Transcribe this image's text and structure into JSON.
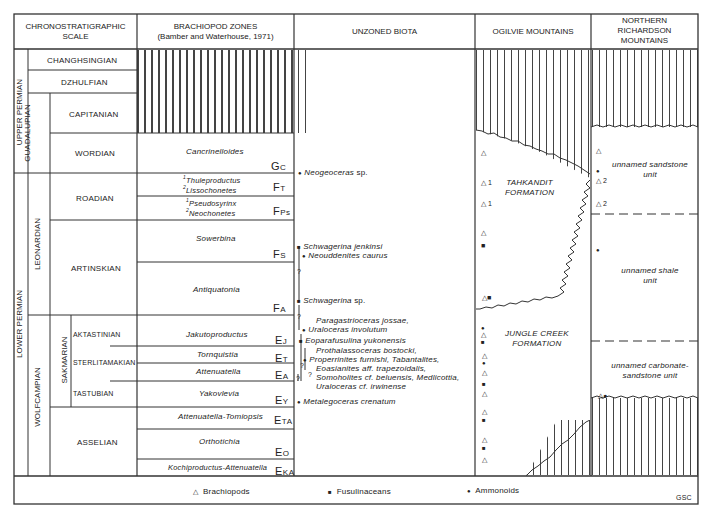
{
  "headers": {
    "chrono": "CHRONOSTRATIGRAPHIC SCALE",
    "chrono_line1": "CHRONOSTRATIGRAPHIC",
    "chrono_line2": "SCALE",
    "brachiopod_line1": "BRACHIOPOD ZONES",
    "brachiopod_line2": "(Bamber and Waterhouse, 1971)",
    "unzoned": "UNZONED BIOTA",
    "ogilvie": "OGILVIE MOUNTAINS",
    "richardson_line1": "NORTHERN",
    "richardson_line2": "RICHARDSON",
    "richardson_line3": "MOUNTAINS"
  },
  "series": {
    "upper": "UPPER PERMIAN",
    "lower": "LOWER PERMIAN"
  },
  "subseries": {
    "guadalupian": "GUADALUPIAN",
    "leonardian": "LEONARDIAN",
    "wolfcampian": "WOLFCAMPIAN",
    "sakmarian": "SAKMARIAN"
  },
  "stages": {
    "changhsingian": "CHANGHSINGIAN",
    "dzhulfian": "DZHULFIAN",
    "capitanian": "CAPITANIAN",
    "wordian": "WORDIAN",
    "roadian": "ROADIAN",
    "artinskian": "ARTINSKIAN",
    "aktastinian": "AKTASTINIAN",
    "sterlitamakian": "STERLITAMAKIAN",
    "tastubian": "TASTUBIAN",
    "asselian": "ASSELIAN"
  },
  "zones": [
    {
      "name": "Cancrinelloides",
      "code": "G",
      "sub": "C"
    },
    {
      "sup1": "1",
      "name1": "Thuleproductus",
      "sup2": "2",
      "name2": "Lissochonetes",
      "code": "F",
      "sub": "T"
    },
    {
      "sup1": "1",
      "name1": "Pseudosyrinx",
      "sup2": "2",
      "name2": "Neochonetes",
      "code": "F",
      "sub": "Ps"
    },
    {
      "name": "Sowerbina",
      "code": "F",
      "sub": "S"
    },
    {
      "name": "Antiquatonia",
      "code": "F",
      "sub": "A"
    },
    {
      "name": "Jakutoproductus",
      "code": "E",
      "sub": "J"
    },
    {
      "name": "Tornquistia",
      "code": "E",
      "sub": "T"
    },
    {
      "name": "Attenuatella",
      "code": "E",
      "sub": "A"
    },
    {
      "name": "Yakovlevia",
      "code": "E",
      "sub": "Y"
    },
    {
      "name": "Attenuatella-Tomiopsis",
      "code": "E",
      "sub": "TA"
    },
    {
      "name": "Orthotichia",
      "code": "E",
      "sub": "O"
    },
    {
      "name": "Kochiproductus-Attenuatella",
      "code": "E",
      "sub": "KA"
    }
  ],
  "biota": [
    {
      "symbol": "●",
      "name": "Neogeoceras",
      "suffix": " sp."
    },
    {
      "symbol": "■",
      "name": "Schwagerina jenkinsi",
      "suffix": ""
    },
    {
      "symbol": "●",
      "name": "Neouddenites caurus",
      "suffix": ""
    },
    {
      "symbol": "■",
      "name": "Schwagerina",
      "suffix": " sp."
    },
    {
      "symbol": "",
      "name": "Paragastrioceras jossae,",
      "suffix": ""
    },
    {
      "symbol": "●",
      "name": "Uraloceras involutum",
      "suffix": ""
    },
    {
      "symbol": "■",
      "name": "Eoparafusulina yukonensis",
      "suffix": ""
    },
    {
      "symbol": "",
      "name": "Prothalassoceras bostocki,",
      "suffix": ""
    },
    {
      "symbol": "●",
      "name": "Properrinites furnishi, Tabantalites,",
      "suffix": ""
    },
    {
      "symbol": "",
      "name": "Eoasianites aff. trapezoidalis,",
      "suffix": ""
    },
    {
      "symbol": "",
      "name": "Somoholites cf. beluensis, Medlicottia,",
      "suffix": ""
    },
    {
      "symbol": "",
      "name": "Uraloceras cf. irwinense",
      "suffix": ""
    },
    {
      "symbol": "●",
      "name": "Metalegoceras crenatum",
      "suffix": ""
    }
  ],
  "question_mark": "?",
  "ogilvie": {
    "tahkandit_line1": "TAHKANDIT",
    "tahkandit_line2": "FORMATION",
    "jungle_line1": "JUNGLE CREEK",
    "jungle_line2": "FORMATION",
    "symbols": [
      "△",
      "△ 1",
      "△ 1",
      "△",
      "■",
      "△■",
      "●",
      "△",
      "■",
      "△",
      "●",
      "△",
      "■",
      "△",
      "△",
      "■",
      "△",
      "■",
      "△"
    ]
  },
  "richardson": {
    "sandstone_line1": "unnamed sandstone",
    "sandstone_line2": "unit",
    "shale_line1": "unnamed shale",
    "shale_line2": "unit",
    "carbonate_line1": "unnamed carbonate-",
    "carbonate_line2": "sandstone unit",
    "symbols": [
      "△",
      "●",
      "△ 2",
      "△ 2",
      "●",
      "△●"
    ]
  },
  "legend": {
    "brachiopods_symbol": "△",
    "brachiopods": "Brachiopods",
    "fusulinaceans_symbol": "■",
    "fusulinaceans": "Fusulinaceans",
    "ammonoids_symbol": "●",
    "ammonoids": "Ammonoids",
    "credit": "GSC"
  }
}
